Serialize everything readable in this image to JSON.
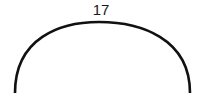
{
  "diagram": {
    "type": "arc",
    "label": "17",
    "stroke_color": "#111111",
    "background": "#ffffff"
  }
}
